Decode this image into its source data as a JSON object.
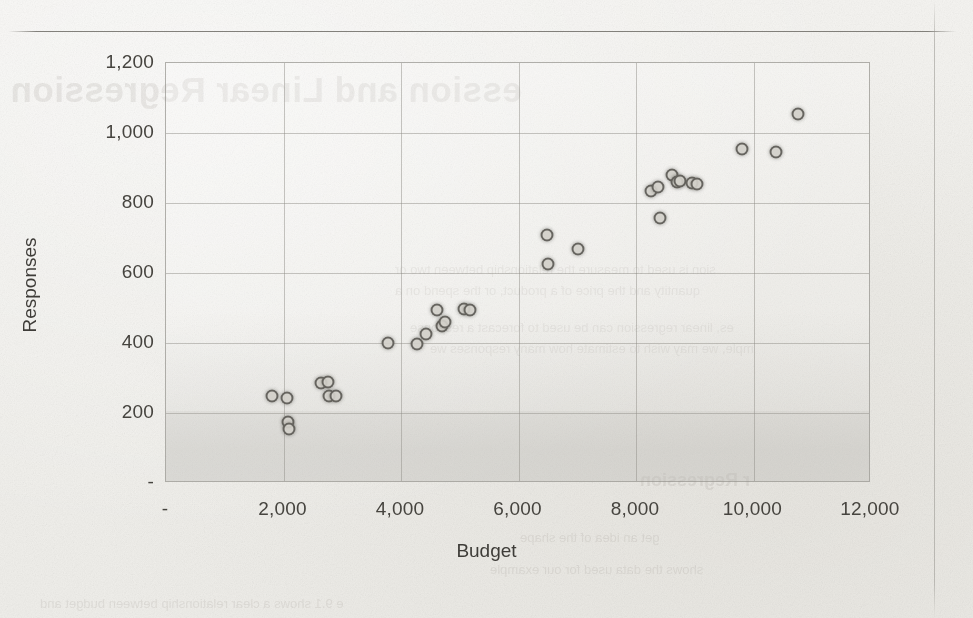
{
  "page": {
    "background_color": "#f3f2ef",
    "ink_color": "#46443f",
    "ghost_text": {
      "title": "ession and Linear Regression",
      "line1": "sion is used to measure the relationship between two or",
      "line2": "quantity and the price of a product, or the spend on a",
      "line3": "es, linear regression can be used to forecast a response",
      "line4": "mple, we may wish to estimate how many responses we",
      "subhead": "r Regression",
      "line5": "get an idea of the shape",
      "line6": "shows the data used for our example",
      "line7": "e 9.1 shows a clear relationship between budget and"
    }
  },
  "chart_data": {
    "type": "scatter",
    "title": "",
    "xlabel": "Budget",
    "ylabel": "Responses",
    "xlim": [
      0,
      12000
    ],
    "ylim": [
      0,
      1200
    ],
    "xticks": [
      "-",
      "2,000",
      "4,000",
      "6,000",
      "8,000",
      "10,000",
      "12,000"
    ],
    "xtick_values": [
      0,
      2000,
      4000,
      6000,
      8000,
      10000,
      12000
    ],
    "yticks": [
      "-",
      "200",
      "400",
      "600",
      "800",
      "1,000",
      "1,200"
    ],
    "ytick_values": [
      0,
      200,
      400,
      600,
      800,
      1000,
      1200
    ],
    "grid": true,
    "legend": false,
    "marker": {
      "shape": "circle",
      "fill_color": "#d1cfc9",
      "edge_color": "#4a4844",
      "size_px": 13
    },
    "series": [
      {
        "name": "Budget vs Responses",
        "points": [
          [
            1800,
            248
          ],
          [
            2060,
            243
          ],
          [
            2080,
            175
          ],
          [
            2090,
            155
          ],
          [
            2640,
            285
          ],
          [
            2760,
            290
          ],
          [
            2780,
            248
          ],
          [
            2900,
            250
          ],
          [
            3780,
            400
          ],
          [
            4280,
            398
          ],
          [
            4420,
            425
          ],
          [
            4620,
            495
          ],
          [
            4700,
            450
          ],
          [
            4750,
            460
          ],
          [
            5080,
            498
          ],
          [
            5180,
            495
          ],
          [
            6480,
            710
          ],
          [
            6510,
            625
          ],
          [
            7020,
            670
          ],
          [
            8260,
            835
          ],
          [
            8380,
            845
          ],
          [
            8400,
            757
          ],
          [
            8620,
            880
          ],
          [
            8700,
            860
          ],
          [
            8750,
            862
          ],
          [
            8960,
            858
          ],
          [
            9040,
            855
          ],
          [
            9800,
            955
          ],
          [
            10380,
            945
          ],
          [
            10760,
            1055
          ]
        ]
      }
    ]
  }
}
